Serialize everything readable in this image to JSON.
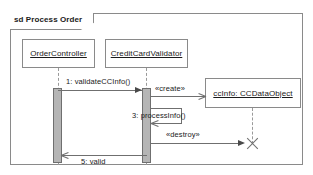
{
  "diagram": {
    "type": "uml-sequence-diagram",
    "frame": {
      "keyword": "sd",
      "label": "sd Process Order",
      "name": "Process Order"
    },
    "lifelines": [
      {
        "id": "order-controller",
        "label": "OrderController",
        "underlined": true
      },
      {
        "id": "cc-validator",
        "label": "CreditCardValidator",
        "underlined": true
      },
      {
        "id": "cc-data-object",
        "label": "ccInfo: CCDataObject",
        "underlined": true,
        "created": true
      }
    ],
    "messages": [
      {
        "seq": "1",
        "label": "1: validateCCInfo()",
        "from": "order-controller",
        "to": "cc-validator",
        "kind": "synchronous"
      },
      {
        "seq": "2",
        "label": "«create»",
        "from": "cc-validator",
        "to": "cc-data-object",
        "kind": "create"
      },
      {
        "seq": "3",
        "label": "3: processInfo()",
        "from": "cc-validator",
        "to": "cc-validator",
        "kind": "self"
      },
      {
        "seq": "4",
        "label": "«destroy»",
        "from": "cc-validator",
        "to": "cc-data-object",
        "kind": "destroy"
      },
      {
        "seq": "5",
        "label": "5: valid",
        "from": "cc-validator",
        "to": "order-controller",
        "kind": "return"
      }
    ],
    "colors": {
      "line": "#6f6f6f",
      "frame_border": "#8a8a8a",
      "activation_fill": "#b5b5b5",
      "activation_border": "#6f6f6f",
      "text": "#1a1a1a",
      "background": "#ffffff"
    }
  }
}
